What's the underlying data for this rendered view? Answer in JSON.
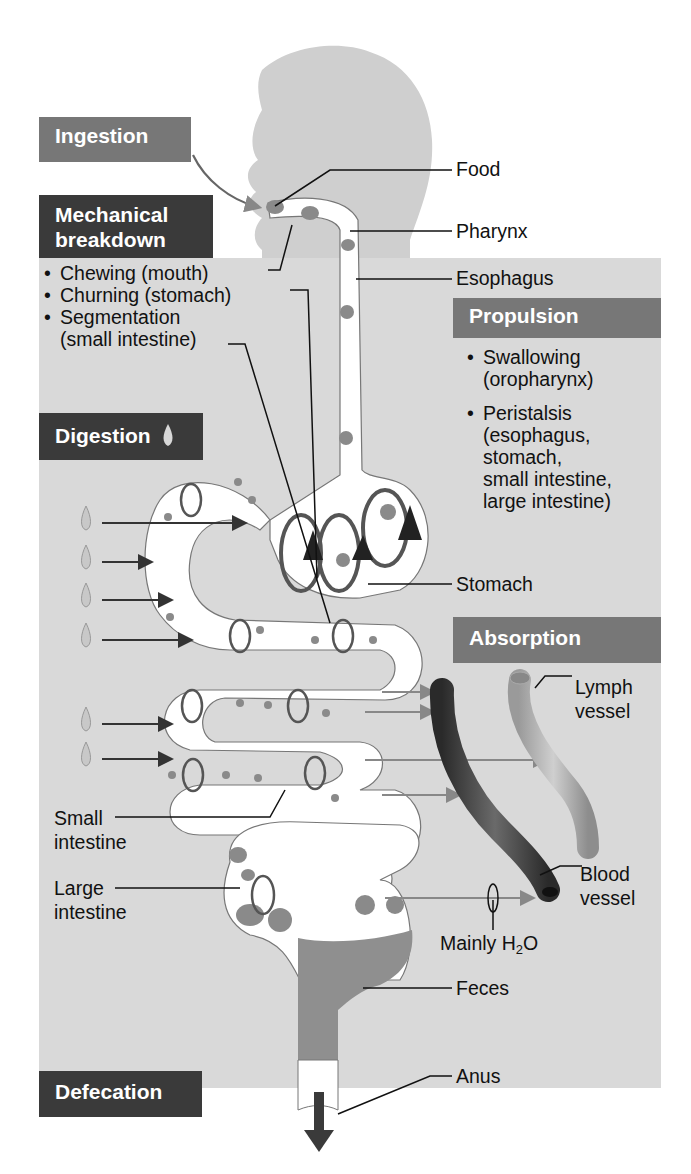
{
  "process_tags": {
    "ingestion": "Ingestion",
    "mechanical_line1": "Mechanical",
    "mechanical_line2": "breakdown",
    "digestion": "Digestion",
    "propulsion": "Propulsion",
    "absorption": "Absorption",
    "defecation": "Defecation"
  },
  "mechanical_items": [
    "Chewing (mouth)",
    "Churning (stomach)",
    "Segmentation",
    "(small intestine)"
  ],
  "propulsion_items": [
    {
      "line1": "Swallowing",
      "line2": "(oropharynx)"
    },
    {
      "line1": "Peristalsis",
      "line2": "(esophagus,",
      "line3": "stomach,",
      "line4": "small intestine,",
      "line5": "large intestine)"
    }
  ],
  "structure_labels": {
    "food": "Food",
    "pharynx": "Pharynx",
    "esophagus": "Esophagus",
    "stomach": "Stomach",
    "lymph_line1": "Lymph",
    "lymph_line2": "vessel",
    "blood_line1": "Blood",
    "blood_line2": "vessel",
    "mainly": "Mainly H",
    "h2o_sub": "2",
    "h2o_end": "O",
    "feces": "Feces",
    "anus": "Anus",
    "small_line1": "Small",
    "small_line2": "intestine",
    "large_line1": "Large",
    "large_line2": "intestine"
  },
  "icons": {
    "digestion_drop": "enzyme-droplet-icon"
  },
  "colors": {
    "dark_tag": "#3a3a3a",
    "mid_tag": "#777777",
    "panel": "#d9d9d9",
    "silhouette": "#cfcfcf",
    "tract_fill": "#ffffff",
    "food_particle": "#8a8a8a",
    "blood_vessel": "#3b3b3b",
    "lymph_vessel": "#a8a8a8"
  }
}
